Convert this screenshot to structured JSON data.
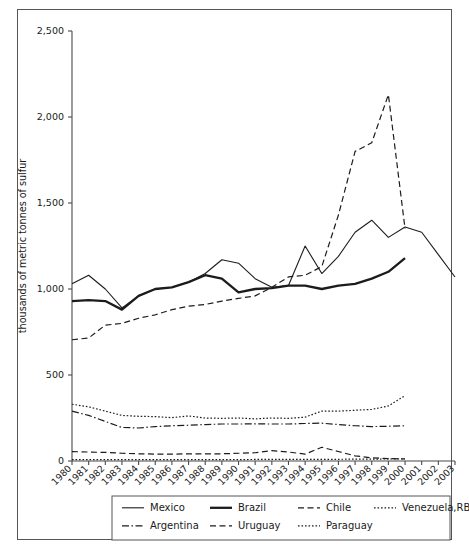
{
  "chart_data": {
    "type": "line",
    "title": "",
    "xlabel": "",
    "ylabel": "thousands of metric tonnes of sulfur",
    "ylim": [
      0,
      2500
    ],
    "ytick_labels": [
      "0",
      "500",
      "1,000",
      "1,500",
      "2,000",
      "2,500"
    ],
    "ytick_values": [
      0,
      500,
      1000,
      1500,
      2000,
      2500
    ],
    "grid": false,
    "legend_position": "bottom",
    "categories": [
      "1980",
      "1981",
      "1982",
      "1983",
      "1984",
      "1985",
      "1986",
      "1987",
      "1988",
      "1989",
      "1990",
      "1991",
      "1992",
      "1993",
      "1994",
      "1995",
      "1996",
      "1997",
      "1998",
      "1999",
      "2000",
      "2001",
      "2002",
      "2003"
    ],
    "series": [
      {
        "name": "Mexico",
        "style": "solid-thin",
        "values": [
          1030,
          1080,
          1000,
          890,
          960,
          1000,
          1010,
          1040,
          1090,
          1170,
          1150,
          1060,
          1010,
          1020,
          1250,
          1090,
          1190,
          1330,
          1400,
          1300,
          1360,
          1330,
          1200,
          1070
        ]
      },
      {
        "name": "Brazil",
        "style": "solid-thick",
        "values": [
          930,
          935,
          930,
          880,
          960,
          1000,
          1010,
          1040,
          1080,
          1060,
          980,
          1000,
          1005,
          1020,
          1020,
          1000,
          1020,
          1030,
          1060,
          1100,
          1180,
          null,
          null,
          null
        ]
      },
      {
        "name": "Chile",
        "style": "dashed",
        "values": [
          705,
          715,
          790,
          800,
          830,
          850,
          880,
          900,
          910,
          930,
          945,
          960,
          1010,
          1070,
          1080,
          1130,
          1430,
          1800,
          1850,
          2130,
          1350,
          null,
          null,
          null
        ]
      },
      {
        "name": "Venezuela,RB",
        "style": "dotted",
        "values": [
          330,
          315,
          290,
          265,
          260,
          258,
          252,
          262,
          250,
          248,
          250,
          245,
          250,
          248,
          255,
          290,
          290,
          295,
          300,
          320,
          380,
          null,
          null,
          null
        ]
      },
      {
        "name": "Argentina",
        "style": "dash-dot",
        "values": [
          290,
          265,
          230,
          195,
          192,
          200,
          205,
          208,
          212,
          215,
          215,
          216,
          215,
          215,
          218,
          220,
          212,
          205,
          200,
          202,
          205,
          null,
          null,
          null
        ]
      },
      {
        "name": "Uruguay",
        "style": "dashed",
        "values": [
          55,
          52,
          50,
          45,
          42,
          40,
          40,
          42,
          42,
          42,
          45,
          48,
          60,
          52,
          40,
          80,
          55,
          30,
          18,
          14,
          12,
          null,
          null,
          null
        ]
      },
      {
        "name": "Paraguay",
        "style": "dotted",
        "values": [
          8,
          8,
          8,
          8,
          8,
          8,
          8,
          8,
          8,
          8,
          8,
          9,
          9,
          9,
          9,
          10,
          10,
          11,
          11,
          12,
          12,
          null,
          null,
          null
        ]
      }
    ]
  },
  "legend": {
    "items": [
      {
        "label": "Mexico",
        "style": "solid-thin"
      },
      {
        "label": "Brazil",
        "style": "solid-thick"
      },
      {
        "label": "Chile",
        "style": "dashed"
      },
      {
        "label": "Venezuela,RB",
        "style": "dotted"
      },
      {
        "label": "Argentina",
        "style": "dash-dot"
      },
      {
        "label": "Uruguay",
        "style": "dashed"
      },
      {
        "label": "Paraguay",
        "style": "dotted"
      }
    ]
  },
  "colors": {
    "line": "#1c1c1c",
    "axis": "#4a4a4a",
    "frame": "#555555",
    "background": "#ffffff"
  }
}
